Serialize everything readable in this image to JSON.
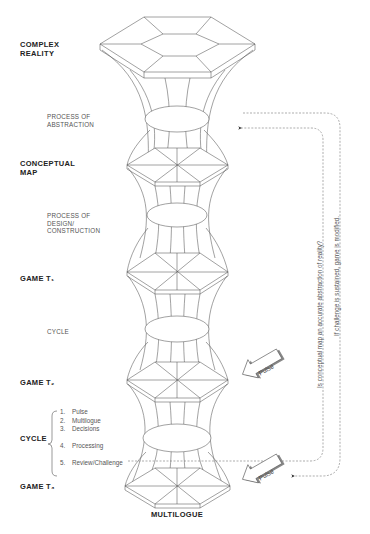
{
  "labels": {
    "complex_reality": [
      "COMPLEX",
      "REALITY"
    ],
    "process_abstraction": [
      "PROCESS OF",
      "ABSTRACTION"
    ],
    "conceptual_map": [
      "CONCEPTUAL",
      "MAP"
    ],
    "process_design": [
      "PROCESS OF",
      "DESIGN/",
      "CONSTRUCTION"
    ],
    "game_t1": "GAME T₁",
    "cycle_mid": "CYCLE",
    "game_t2": "GAME T₂",
    "cycle": "CYCLE",
    "game_t3": "GAME T₃",
    "multilogue": "MULTILOGUE"
  },
  "cycle_steps": [
    {
      "num": "1.",
      "label": "Pulse"
    },
    {
      "num": "2.",
      "label": "Multilogue"
    },
    {
      "num": "3.",
      "label": "Decisions"
    },
    {
      "num": "4.",
      "label": "Processing"
    },
    {
      "num": "5.",
      "label": "Review/Challenge"
    }
  ],
  "feedback": {
    "inner": "Is conceptual map an accurate abstraction of reality?",
    "outer": "If challenge is sustained, game is modified."
  },
  "pulse_arrows": [
    "Pulse",
    "Pulse"
  ],
  "colors": {
    "line": "#555555",
    "dashed": "#777777",
    "text_bold": "#222222",
    "text_thin": "#555555"
  }
}
